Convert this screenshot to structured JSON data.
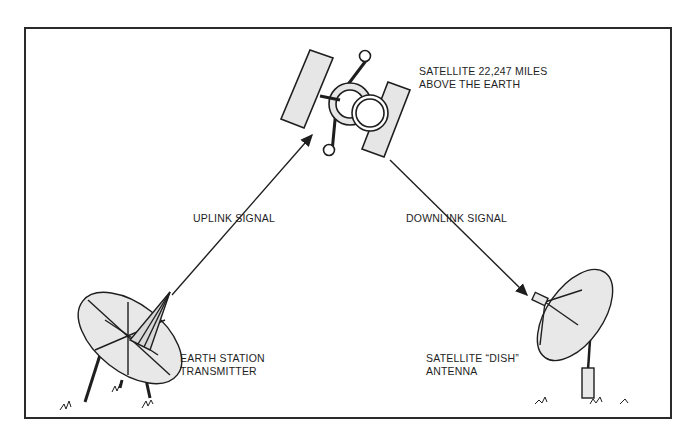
{
  "diagram": {
    "satellite_label": {
      "line1": "SATELLITE 22,247 MILES",
      "line2": "ABOVE THE EARTH"
    },
    "uplink_label": "UPLINK SIGNAL",
    "downlink_label": "DOWNLINK SIGNAL",
    "earth_station_label": {
      "line1": "EARTH STATION",
      "line2": "TRANSMITTER"
    },
    "dish_label": {
      "line1": "SATELLITE “DISH”",
      "line2": "ANTENNA"
    },
    "colors": {
      "line": "#1e1e1e",
      "fill": "#e6e6e6",
      "background": "#ffffff"
    }
  }
}
